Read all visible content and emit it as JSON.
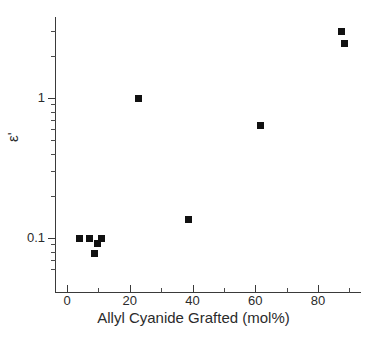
{
  "chart_data": {
    "type": "scatter",
    "title": "",
    "xlabel": "Allyl Cyanide Grafted (mol%)",
    "ylabel": "ε'",
    "yscale": "log",
    "xscale": "linear",
    "xlim": [
      -3,
      93
    ],
    "ylim": [
      0.055,
      4.0
    ],
    "grid": false,
    "legend": null,
    "marker": "filled-square",
    "marker_color": "#111111",
    "x": [
      4.0,
      7.2,
      8.8,
      9.7,
      11.0,
      22.8,
      38.8,
      61.8,
      87.4,
      88.5
    ],
    "y": [
      0.1,
      0.1,
      0.077,
      0.091,
      0.1,
      0.99,
      0.135,
      0.64,
      3.0,
      2.45
    ],
    "points": [
      {
        "x": 4.0,
        "y": 0.1
      },
      {
        "x": 7.2,
        "y": 0.1
      },
      {
        "x": 8.8,
        "y": 0.077
      },
      {
        "x": 9.7,
        "y": 0.091
      },
      {
        "x": 11.0,
        "y": 0.1
      },
      {
        "x": 22.8,
        "y": 0.99
      },
      {
        "x": 38.8,
        "y": 0.135
      },
      {
        "x": 61.8,
        "y": 0.64
      },
      {
        "x": 87.4,
        "y": 3.0
      },
      {
        "x": 88.5,
        "y": 2.45
      }
    ],
    "xticks": [
      0,
      20,
      40,
      60,
      80
    ],
    "xtick_labels": [
      "0",
      "20",
      "40",
      "60",
      "80"
    ],
    "x_minor_ticks": [
      10,
      30,
      50,
      70,
      90
    ],
    "yticks": [
      1,
      0.1
    ],
    "ytick_labels": [
      "1",
      "0.1"
    ],
    "y_minor_ticks": [
      3,
      2,
      0.9,
      0.8,
      0.7,
      0.6,
      0.5,
      0.4,
      0.3,
      0.2,
      0.09,
      0.08,
      0.07,
      0.06
    ]
  }
}
